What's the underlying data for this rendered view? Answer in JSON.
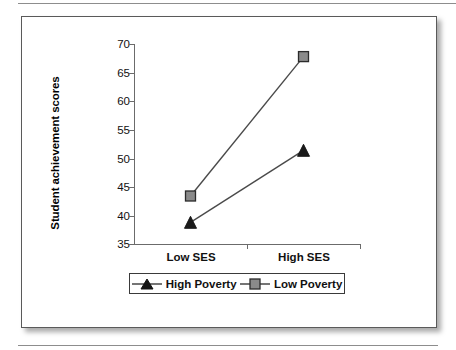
{
  "figure": {
    "background_color": "#ffffff",
    "frame_border_color": "#5a5a5a",
    "rule_color": "#8d8d8d"
  },
  "chart_data": {
    "type": "line",
    "title": "",
    "xlabel": "",
    "ylabel": "Student achievement scores",
    "categories": [
      "Low SES",
      "High SES"
    ],
    "ylim": [
      35,
      70
    ],
    "yticks": [
      35,
      40,
      45,
      50,
      55,
      60,
      65,
      70
    ],
    "ytick_labels": [
      "35",
      "40",
      "45",
      "50",
      "55",
      "60",
      "65",
      "70"
    ],
    "grid": false,
    "legend_position": "bottom",
    "series": [
      {
        "name": "High Poverty",
        "values": [
          38.8,
          51.4
        ],
        "marker": "triangle",
        "marker_color": "#1a1a1a",
        "line_color": "#4a4a4a"
      },
      {
        "name": "Low Poverty",
        "values": [
          43.4,
          67.8
        ],
        "marker": "square",
        "marker_color": "#8a8a8a",
        "line_color": "#4a4a4a"
      }
    ]
  },
  "axis": {
    "y_title": "Student achievement scores",
    "y_tick_labels": [
      "70",
      "65",
      "60",
      "55",
      "50",
      "45",
      "40",
      "35"
    ],
    "x_tick_labels": [
      "Low SES",
      "High SES"
    ]
  },
  "legend": {
    "entries": [
      {
        "label": "High Poverty",
        "marker": "triangle-marker"
      },
      {
        "label": "Low Poverty",
        "marker": "square-marker"
      }
    ]
  }
}
